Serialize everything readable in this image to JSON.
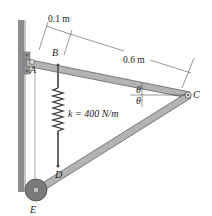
{
  "diagram": {
    "points": {
      "A": "A",
      "B": "B",
      "C": "C",
      "D": "D",
      "E": "E"
    },
    "dimensions": {
      "short": "0.1 m",
      "long": "0.6 m"
    },
    "spring": {
      "label": "k = 400 N/m"
    },
    "angles": {
      "upper": "θ",
      "lower": "θ"
    },
    "colors": {
      "bar_fill": "#b3b3b3",
      "bar_stroke": "#555555",
      "wall": "#8c8c8c",
      "roller": "#7a7a7a",
      "line": "#333333"
    }
  }
}
